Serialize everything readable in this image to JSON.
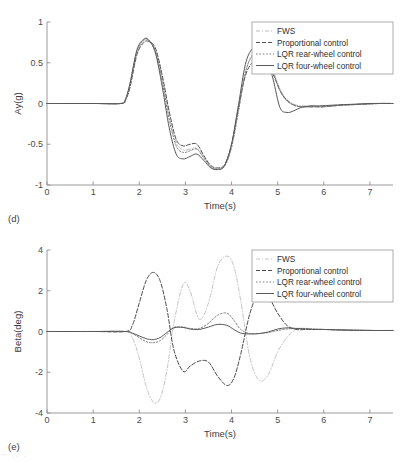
{
  "figure": {
    "background": "#ffffff",
    "bottom_artifact": "~ .. ."
  },
  "chart_data": [
    {
      "type": "line",
      "panel_label": "(d)",
      "title": "",
      "xlabel": "Time(s)",
      "ylabel": "Ay(g)",
      "xlim": [
        0,
        7.5
      ],
      "ylim": [
        -1,
        1
      ],
      "xticks": [
        0,
        1,
        2,
        3,
        4,
        5,
        6,
        7
      ],
      "xticklabels": [
        "0",
        "1",
        "2",
        "3",
        "4",
        "5",
        "6",
        "7"
      ],
      "yticks": [
        -1,
        -0.5,
        0,
        0.5,
        1
      ],
      "yticklabels": [
        "-1",
        "-0.5",
        "0",
        "0.5",
        "1"
      ],
      "grid": false,
      "legend_position": "upper right",
      "series": [
        {
          "name": "FWS",
          "style": "dashdot",
          "color": "#b9b9b9",
          "width": 1.0,
          "x": [
            0,
            1.0,
            1.6,
            1.7,
            1.8,
            1.95,
            2.1,
            2.2,
            2.35,
            2.5,
            2.65,
            2.8,
            2.95,
            3.1,
            3.25,
            3.4,
            3.55,
            3.7,
            3.85,
            4.0,
            4.15,
            4.3,
            4.45,
            4.6,
            4.75,
            4.9,
            5.05,
            5.2,
            5.4,
            5.6,
            5.8,
            6.0,
            6.4,
            6.8,
            7.2,
            7.5
          ],
          "y": [
            0,
            0,
            0,
            0.04,
            0.22,
            0.62,
            0.77,
            0.78,
            0.66,
            0.3,
            -0.15,
            -0.48,
            -0.57,
            -0.56,
            -0.55,
            -0.66,
            -0.77,
            -0.8,
            -0.76,
            -0.52,
            -0.08,
            0.38,
            0.6,
            0.6,
            0.55,
            0.4,
            0.18,
            0.05,
            -0.02,
            -0.03,
            -0.03,
            -0.03,
            -0.02,
            -0.01,
            0,
            0
          ]
        },
        {
          "name": "Proportional control",
          "style": "dashed",
          "color": "#4f4f4f",
          "width": 1.0,
          "x": [
            0,
            1.0,
            1.6,
            1.7,
            1.8,
            1.95,
            2.1,
            2.2,
            2.35,
            2.5,
            2.65,
            2.8,
            2.95,
            3.1,
            3.25,
            3.4,
            3.55,
            3.7,
            3.85,
            4.0,
            4.15,
            4.3,
            4.45,
            4.6,
            4.75,
            4.9,
            5.05,
            5.2,
            5.4,
            5.6,
            5.8,
            6.0,
            6.4,
            6.8,
            7.2,
            7.5
          ],
          "y": [
            0,
            0,
            0,
            0.04,
            0.2,
            0.6,
            0.75,
            0.76,
            0.68,
            0.34,
            -0.1,
            -0.44,
            -0.52,
            -0.5,
            -0.5,
            -0.64,
            -0.76,
            -0.79,
            -0.75,
            -0.5,
            -0.05,
            0.34,
            0.5,
            0.51,
            0.5,
            0.36,
            0.16,
            0.04,
            -0.03,
            -0.04,
            -0.04,
            -0.04,
            -0.02,
            -0.01,
            0,
            0
          ]
        },
        {
          "name": "LQR rear-wheel control",
          "style": "dotted",
          "color": "#7c7c7c",
          "width": 1.0,
          "x": [
            0,
            1.0,
            1.6,
            1.7,
            1.8,
            1.95,
            2.1,
            2.2,
            2.35,
            2.5,
            2.65,
            2.8,
            2.95,
            3.1,
            3.25,
            3.4,
            3.55,
            3.7,
            3.85,
            4.0,
            4.15,
            4.3,
            4.45,
            4.6,
            4.75,
            4.9,
            5.05,
            5.2,
            5.4,
            5.6,
            5.8,
            6.0,
            6.4,
            6.8,
            7.2,
            7.5
          ],
          "y": [
            0,
            0,
            0,
            0.05,
            0.24,
            0.64,
            0.78,
            0.78,
            0.64,
            0.26,
            -0.2,
            -0.52,
            -0.6,
            -0.58,
            -0.56,
            -0.67,
            -0.78,
            -0.81,
            -0.77,
            -0.54,
            -0.1,
            0.38,
            0.58,
            0.58,
            0.53,
            0.38,
            0.16,
            0.03,
            -0.03,
            -0.04,
            -0.04,
            -0.04,
            -0.02,
            -0.01,
            0,
            0
          ]
        },
        {
          "name": "LQR four-wheel control",
          "style": "solid",
          "color": "#585858",
          "width": 1.0,
          "x": [
            0,
            1.0,
            1.6,
            1.7,
            1.8,
            1.95,
            2.1,
            2.2,
            2.35,
            2.5,
            2.65,
            2.8,
            2.95,
            3.1,
            3.25,
            3.4,
            3.55,
            3.7,
            3.85,
            4.0,
            4.15,
            4.3,
            4.45,
            4.6,
            4.75,
            4.9,
            5.05,
            5.2,
            5.35,
            5.5,
            5.7,
            5.9,
            6.2,
            6.6,
            7.0,
            7.5
          ],
          "y": [
            0,
            0,
            0,
            0.05,
            0.25,
            0.66,
            0.79,
            0.78,
            0.62,
            0.2,
            -0.3,
            -0.62,
            -0.68,
            -0.65,
            -0.62,
            -0.7,
            -0.79,
            -0.81,
            -0.76,
            -0.5,
            -0.02,
            0.48,
            0.67,
            0.68,
            0.6,
            0.3,
            -0.05,
            -0.11,
            -0.09,
            -0.05,
            -0.03,
            -0.03,
            -0.02,
            -0.01,
            0,
            0
          ]
        }
      ],
      "legend": [
        {
          "label": "FWS",
          "style": "dashdot",
          "color": "#b9b9b9"
        },
        {
          "label": "Proportional control",
          "style": "dashed",
          "color": "#4f4f4f"
        },
        {
          "label": "LQR rear-wheel control",
          "style": "dotted",
          "color": "#7c7c7c"
        },
        {
          "label": "LQR four-wheel control",
          "style": "solid",
          "color": "#585858"
        }
      ]
    },
    {
      "type": "line",
      "panel_label": "(e)",
      "title": "",
      "xlabel": "Time(s)",
      "ylabel": "Beta(deg)",
      "xlim": [
        0,
        7.5
      ],
      "ylim": [
        -4,
        4
      ],
      "xticks": [
        0,
        1,
        2,
        3,
        4,
        5,
        6,
        7
      ],
      "xticklabels": [
        "0",
        "1",
        "2",
        "3",
        "4",
        "5",
        "6",
        "7"
      ],
      "yticks": [
        -4,
        -2,
        0,
        2,
        4
      ],
      "yticklabels": [
        "-4",
        "-2",
        "0",
        "2",
        "4"
      ],
      "grid": false,
      "legend_position": "upper right",
      "series": [
        {
          "name": "FWS",
          "style": "dashdot",
          "color": "#c3c3c3",
          "width": 1.0,
          "x": [
            0,
            1.0,
            1.7,
            1.85,
            2.0,
            2.15,
            2.3,
            2.45,
            2.6,
            2.75,
            2.95,
            3.1,
            3.3,
            3.5,
            3.7,
            3.9,
            4.05,
            4.2,
            4.4,
            4.6,
            4.8,
            5.0,
            5.2,
            5.4,
            5.6,
            5.8,
            6.0,
            6.3,
            6.7,
            7.1,
            7.5
          ],
          "y": [
            0,
            0,
            0,
            -0.3,
            -1.3,
            -2.7,
            -3.45,
            -3.3,
            -1.9,
            0.4,
            2.3,
            2.0,
            0.6,
            1.4,
            3.2,
            3.7,
            3.2,
            1.5,
            -1.3,
            -2.4,
            -2.1,
            -1.0,
            -0.3,
            0.1,
            0.15,
            0.12,
            0.1,
            0.08,
            0.06,
            0.05,
            0.05
          ]
        },
        {
          "name": "Proportional control",
          "style": "dashed",
          "color": "#4a4a4a",
          "width": 1.0,
          "x": [
            0,
            1.0,
            1.7,
            1.85,
            2.0,
            2.15,
            2.3,
            2.45,
            2.6,
            2.75,
            2.95,
            3.1,
            3.3,
            3.5,
            3.7,
            3.9,
            4.05,
            4.2,
            4.4,
            4.6,
            4.8,
            5.0,
            5.2,
            5.4,
            5.6,
            5.8,
            6.0,
            6.3,
            6.7,
            7.1,
            7.5
          ],
          "y": [
            0,
            0,
            0,
            0.3,
            1.4,
            2.5,
            2.9,
            2.5,
            1.1,
            -0.9,
            -1.95,
            -1.7,
            -1.45,
            -1.5,
            -2.2,
            -2.65,
            -2.3,
            -1.1,
            0.9,
            1.95,
            1.7,
            0.9,
            0.3,
            0.1,
            0.1,
            0.1,
            0.1,
            0.08,
            0.06,
            0.05,
            0.05
          ]
        },
        {
          "name": "LQR rear-wheel control",
          "style": "dotted",
          "color": "#808080",
          "width": 1.0,
          "x": [
            0,
            1.0,
            1.7,
            1.85,
            2.0,
            2.15,
            2.3,
            2.45,
            2.6,
            2.75,
            2.95,
            3.1,
            3.3,
            3.5,
            3.7,
            3.9,
            4.05,
            4.2,
            4.4,
            4.6,
            4.8,
            5.0,
            5.2,
            5.4,
            5.6,
            5.8,
            6.0,
            6.3,
            6.7,
            7.1,
            7.5
          ],
          "y": [
            0,
            0,
            0,
            -0.1,
            -0.3,
            -0.5,
            -0.55,
            -0.45,
            -0.15,
            0.2,
            0.22,
            0.15,
            0.15,
            0.4,
            0.8,
            0.9,
            0.55,
            0.1,
            -0.1,
            -0.1,
            -0.05,
            0.05,
            0.12,
            0.15,
            0.15,
            0.12,
            0.1,
            0.08,
            0.06,
            0.05,
            0.05
          ]
        },
        {
          "name": "LQR four-wheel control",
          "style": "solid",
          "color": "#585858",
          "width": 1.0,
          "x": [
            0,
            1.0,
            1.7,
            1.85,
            2.0,
            2.15,
            2.3,
            2.45,
            2.6,
            2.75,
            2.95,
            3.1,
            3.3,
            3.5,
            3.7,
            3.9,
            4.05,
            4.2,
            4.4,
            4.6,
            4.8,
            5.0,
            5.2,
            5.4,
            5.6,
            5.8,
            6.0,
            6.3,
            6.7,
            7.1,
            7.5
          ],
          "y": [
            0,
            0,
            0,
            -0.08,
            -0.22,
            -0.35,
            -0.4,
            -0.3,
            -0.05,
            0.18,
            0.2,
            0.12,
            0.1,
            0.22,
            0.35,
            0.3,
            0.1,
            -0.08,
            -0.12,
            -0.1,
            -0.02,
            0.12,
            0.18,
            0.15,
            0.12,
            0.1,
            0.1,
            0.08,
            0.06,
            0.05,
            0.05
          ]
        }
      ],
      "legend": [
        {
          "label": "FWS",
          "style": "dashdot",
          "color": "#c3c3c3"
        },
        {
          "label": "Proportional control",
          "style": "dashed",
          "color": "#4a4a4a"
        },
        {
          "label": "LQR rear-wheel control",
          "style": "dotted",
          "color": "#808080"
        },
        {
          "label": "LQR four-wheel control",
          "style": "solid",
          "color": "#585858"
        }
      ]
    }
  ]
}
